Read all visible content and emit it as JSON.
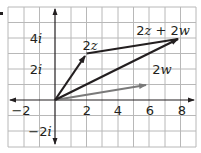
{
  "figure": {
    "type": "complex-plane-vector-addition",
    "x_ticks": [
      {
        "value": -2,
        "label": "−2"
      },
      {
        "value": 2,
        "label": "2"
      },
      {
        "value": 4,
        "label": "4"
      },
      {
        "value": 6,
        "label": "6"
      },
      {
        "value": 8,
        "label": "8"
      }
    ],
    "y_ticks": [
      {
        "value": 4,
        "label": "4",
        "unit": "i"
      },
      {
        "value": 2,
        "label": "2",
        "unit": "i"
      },
      {
        "value": -2,
        "label": "−2",
        "unit": "i"
      }
    ],
    "vectors": [
      {
        "name": "2z",
        "label_num": "2",
        "label_var": "z",
        "to": [
          2,
          3
        ],
        "color": "#231f20"
      },
      {
        "name": "2w",
        "label_num": "2",
        "label_var": "w",
        "to": [
          6,
          1
        ],
        "color": "#7a7a7a"
      },
      {
        "name": "2z + 2w",
        "label_num": "2",
        "label_var": "z + 2w",
        "to": [
          8,
          4
        ],
        "color": "#231f20"
      }
    ],
    "segments": [
      {
        "from": [
          2,
          3
        ],
        "to": [
          8,
          4
        ],
        "color": "#231f20"
      }
    ],
    "labels": {
      "two_z": {
        "a": "2",
        "b": "z"
      },
      "two_w": {
        "a": "2",
        "b": "w"
      },
      "sum": {
        "a": "2",
        "b": "z",
        "plus": " + ",
        "c": "2",
        "d": "w"
      },
      "y4": {
        "n": "4",
        "i": "i"
      },
      "y2": {
        "n": "2",
        "i": "i"
      },
      "ym2": {
        "n": "−2",
        "i": "i"
      },
      "xm2": "−2",
      "x2": "2",
      "x4": "4",
      "x6": "6",
      "x8": "8"
    },
    "colors": {
      "grid": "#b8b8b8",
      "axis": "#231f20",
      "vector_dark": "#231f20",
      "vector_gray": "#7a7a7a"
    }
  }
}
